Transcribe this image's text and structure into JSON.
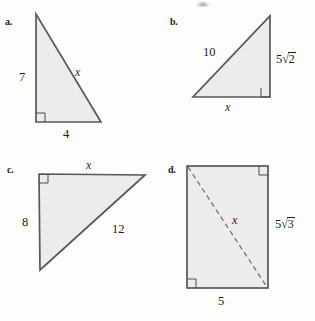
{
  "figures": [
    {
      "id": "a",
      "label": "a.",
      "shape": "right-triangle",
      "right_angle_at": "bottom-left",
      "labels": {
        "vertical_leg": "7",
        "horizontal_leg": "4",
        "hypotenuse": "x"
      }
    },
    {
      "id": "b",
      "label": "b.",
      "shape": "right-triangle",
      "right_angle_at": "bottom-right",
      "labels": {
        "hypotenuse": "10",
        "vertical_leg_coefficient": "5",
        "vertical_leg_radicand": "2",
        "horizontal_leg": "x"
      }
    },
    {
      "id": "c",
      "label": "c.",
      "shape": "right-triangle",
      "right_angle_at": "top-left",
      "labels": {
        "top_leg": "x",
        "vertical_leg": "8",
        "hypotenuse": "12"
      }
    },
    {
      "id": "d",
      "label": "d.",
      "shape": "rectangle-with-diagonal",
      "right_angle_marks": [
        "top-right",
        "bottom-left"
      ],
      "labels": {
        "diagonal": "x",
        "height_coefficient": "5",
        "height_radicand": "3",
        "width": "5"
      }
    }
  ],
  "style": {
    "fill": "#ececec",
    "stroke": "#58585a",
    "page_background": "#fdfdfc",
    "radical_glyph": "√"
  }
}
